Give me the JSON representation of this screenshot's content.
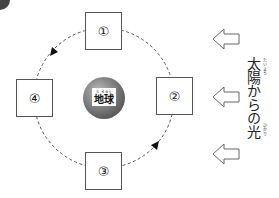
{
  "diagram": {
    "title": "太陽からの光",
    "earth": {
      "label": "地球",
      "ruby": "ち きゅう"
    },
    "positions": [
      {
        "id": "1",
        "label": "①",
        "location": "top"
      },
      {
        "id": "2",
        "label": "②",
        "location": "right"
      },
      {
        "id": "3",
        "label": "③",
        "location": "bottom"
      },
      {
        "id": "4",
        "label": "④",
        "location": "left"
      }
    ],
    "orbit": {
      "style": "dashed",
      "direction": "counter-clockwise (1 → 4 → 3 → 2)"
    },
    "sunlight": {
      "label": "太陽からの光",
      "label_part1": "太陽",
      "label_part1_ruby": "たいよう",
      "label_part2": "からの",
      "label_part3": "光",
      "label_part3_ruby": "ひかり",
      "arrow_count": 3,
      "arrow_direction": "left"
    },
    "colors": {
      "line": "#555555",
      "globe_dark": "#3d3d3d",
      "globe_light": "#bdbdbd"
    }
  }
}
